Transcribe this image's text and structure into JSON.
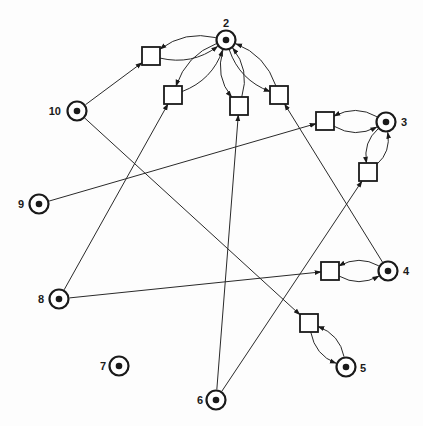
{
  "diagram": {
    "type": "petri-net",
    "colors": {
      "stroke": "#1a1a1a",
      "background": "#ffffff"
    },
    "places": [
      {
        "id": "p2",
        "label": "2",
        "tokens": 1
      },
      {
        "id": "p3",
        "label": "3",
        "tokens": 1
      },
      {
        "id": "p4",
        "label": "4",
        "tokens": 1
      },
      {
        "id": "p5",
        "label": "5",
        "tokens": 1
      },
      {
        "id": "p6",
        "label": "6",
        "tokens": 1
      },
      {
        "id": "p7",
        "label": "7",
        "tokens": 1
      },
      {
        "id": "p8",
        "label": "8",
        "tokens": 1
      },
      {
        "id": "p9",
        "label": "9",
        "tokens": 1
      },
      {
        "id": "p10",
        "label": "10",
        "tokens": 1
      }
    ],
    "transitions": [
      {
        "id": "t1"
      },
      {
        "id": "t2"
      },
      {
        "id": "t3"
      },
      {
        "id": "t4"
      },
      {
        "id": "t5"
      },
      {
        "id": "t6"
      },
      {
        "id": "t7"
      },
      {
        "id": "t8"
      }
    ],
    "arcs": [
      {
        "from": "p10",
        "to": "t1"
      },
      {
        "from": "p10",
        "to": "t8"
      },
      {
        "from": "p8",
        "to": "t2"
      },
      {
        "from": "p6",
        "to": "t3"
      },
      {
        "from": "p4",
        "to": "t4"
      },
      {
        "from": "p9",
        "to": "t5"
      },
      {
        "from": "p6",
        "to": "t6"
      },
      {
        "from": "p8",
        "to": "t7"
      },
      {
        "from": "t1",
        "to": "p2"
      },
      {
        "from": "p2",
        "to": "t1"
      },
      {
        "from": "t2",
        "to": "p2"
      },
      {
        "from": "p2",
        "to": "t2"
      },
      {
        "from": "t3",
        "to": "p2"
      },
      {
        "from": "p2",
        "to": "t3"
      },
      {
        "from": "t4",
        "to": "p2"
      },
      {
        "from": "p2",
        "to": "t4"
      },
      {
        "from": "t5",
        "to": "p3"
      },
      {
        "from": "p3",
        "to": "t5"
      },
      {
        "from": "t6",
        "to": "p3"
      },
      {
        "from": "p3",
        "to": "t6"
      },
      {
        "from": "t7",
        "to": "p4"
      },
      {
        "from": "p4",
        "to": "t7"
      },
      {
        "from": "t8",
        "to": "p5"
      },
      {
        "from": "p5",
        "to": "t8"
      }
    ]
  }
}
